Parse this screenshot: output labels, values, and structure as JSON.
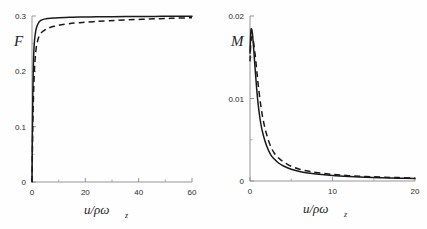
{
  "figure": {
    "background_color": "#fefefe",
    "curve_color": "#1a1a1a",
    "axis_color": "#8a8a8a",
    "panel_count": 2
  },
  "chart_data": [
    {
      "type": "line",
      "panel": "left",
      "title": "",
      "ylabel": "F",
      "xlabel": "u/ρω",
      "xlabel_sub": "z",
      "xlim": [
        0,
        60
      ],
      "ylim": [
        0,
        0.3
      ],
      "grid": false,
      "legend": "none",
      "xticks": [
        0,
        20,
        40,
        60
      ],
      "xtick_labels": [
        "0",
        "20",
        "40",
        "60"
      ],
      "xticks_minor": [
        10,
        30,
        50
      ],
      "yticks": [
        0,
        0.1,
        0.2,
        0.3
      ],
      "ytick_labels": [
        "0",
        "0.1",
        "0.2",
        "0.3"
      ],
      "yticks_minor": [
        0.05,
        0.15,
        0.25
      ],
      "series": [
        {
          "name": "solid",
          "style": "solid",
          "x": [
            0,
            0.15,
            0.3,
            0.5,
            0.7,
            0.9,
            1.1,
            1.4,
            1.7,
            2.0,
            2.5,
            3.0,
            3.5,
            4.0,
            5.0,
            6.0,
            8.0,
            10.0,
            14.0,
            18.0,
            24.0,
            30.0,
            38.0,
            46.0,
            54.0,
            60.0
          ],
          "y": [
            0,
            0.09,
            0.155,
            0.208,
            0.237,
            0.253,
            0.263,
            0.273,
            0.279,
            0.283,
            0.288,
            0.291,
            0.2925,
            0.2935,
            0.2948,
            0.2955,
            0.2965,
            0.297,
            0.2977,
            0.2981,
            0.2985,
            0.2988,
            0.2991,
            0.2993,
            0.2995,
            0.2996
          ]
        },
        {
          "name": "dashed",
          "style": "dashed",
          "x": [
            0,
            0.2,
            0.4,
            0.6,
            0.9,
            1.2,
            1.6,
            2.0,
            2.6,
            3.2,
            4.0,
            5.0,
            6.0,
            7.5,
            9.0,
            11.0,
            14.0,
            18.0,
            23.0,
            29.0,
            36.0,
            44.0,
            52.0,
            60.0
          ],
          "y": [
            0,
            0.072,
            0.125,
            0.163,
            0.201,
            0.224,
            0.243,
            0.253,
            0.263,
            0.268,
            0.272,
            0.2755,
            0.278,
            0.2805,
            0.282,
            0.284,
            0.2862,
            0.288,
            0.2898,
            0.2915,
            0.293,
            0.2945,
            0.2958,
            0.2968
          ]
        }
      ]
    },
    {
      "type": "line",
      "panel": "right",
      "title": "",
      "ylabel": "M",
      "xlabel": "u/ρω",
      "xlabel_sub": "z",
      "xlim": [
        0,
        20
      ],
      "ylim": [
        0,
        0.02
      ],
      "grid": false,
      "legend": "none",
      "xticks": [
        0,
        10,
        20
      ],
      "xtick_labels": [
        "0",
        "10",
        "20"
      ],
      "xticks_minor": [
        5,
        15
      ],
      "yticks": [
        0,
        0.01,
        0.02
      ],
      "ytick_labels": [
        "0",
        "0.01",
        "0.02"
      ],
      "yticks_minor": [
        0.005,
        0.015
      ],
      "series": [
        {
          "name": "solid",
          "style": "solid",
          "x": [
            0,
            0.1,
            0.2,
            0.3,
            0.45,
            0.6,
            0.8,
            1.0,
            1.3,
            1.6,
            2.0,
            2.5,
            3.0,
            3.5,
            4.0,
            5.0,
            6.0,
            7.0,
            8.0,
            10.0,
            12.0,
            14.0,
            16.0,
            18.0,
            20.0
          ],
          "y": [
            0.0155,
            0.0181,
            0.0184,
            0.0178,
            0.016,
            0.0139,
            0.0113,
            0.0092,
            0.007,
            0.0056,
            0.0043,
            0.0032,
            0.0026,
            0.00215,
            0.00185,
            0.00142,
            0.00115,
            0.00097,
            0.00084,
            0.00066,
            0.00054,
            0.00045,
            0.00039,
            0.00034,
            0.0003
          ]
        },
        {
          "name": "dashed",
          "style": "dashed",
          "x": [
            0,
            0.1,
            0.25,
            0.4,
            0.6,
            0.8,
            1.0,
            1.3,
            1.6,
            2.0,
            2.5,
            3.0,
            3.5,
            4.0,
            5.0,
            6.0,
            7.0,
            8.0,
            10.0,
            12.0,
            14.0,
            16.0,
            18.0,
            20.0
          ],
          "y": [
            0.0145,
            0.0168,
            0.0175,
            0.017,
            0.0155,
            0.0136,
            0.0116,
            0.0092,
            0.0074,
            0.0057,
            0.0042,
            0.0033,
            0.00275,
            0.00235,
            0.00178,
            0.00143,
            0.0012,
            0.00103,
            0.0008,
            0.00065,
            0.00055,
            0.00047,
            0.00041,
            0.00036
          ]
        }
      ]
    }
  ]
}
